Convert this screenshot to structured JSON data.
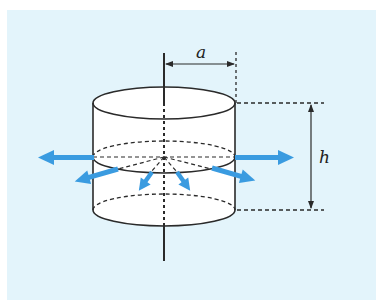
{
  "figure": {
    "background_color": "#e3f4fb",
    "line_color": "#2a2a2a",
    "arrow_color": "#3a9be0",
    "labels": {
      "radius": "a",
      "height": "h"
    },
    "cylinder": {
      "center_x": 164,
      "radius_px": 71,
      "ellipse_ry": 16,
      "top_y": 103,
      "mid_y": 157,
      "bottom_y": 210
    },
    "radial_arrows_count": 6
  }
}
